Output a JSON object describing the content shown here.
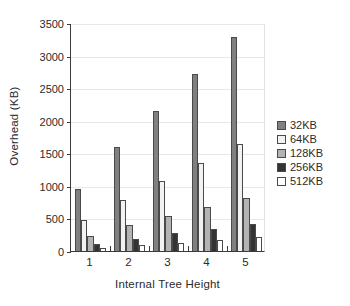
{
  "chart_data": {
    "type": "bar",
    "title": "",
    "xlabel": "Internal Tree Height",
    "ylabel": "Overhead (KB)",
    "categories": [
      "1",
      "2",
      "3",
      "4",
      "5"
    ],
    "ylim": [
      0,
      3500
    ],
    "yticks": [
      0,
      500,
      1000,
      1500,
      2000,
      2500,
      3000,
      3500
    ],
    "ytick_labels": [
      "0",
      "500",
      "1000",
      "1500",
      "2000",
      "2500",
      "3000",
      "3500"
    ],
    "grid": true,
    "legend_position": "right",
    "series": [
      {
        "name": "32KB",
        "color": "#808080",
        "values": [
          950,
          1590,
          2150,
          2720,
          3290
        ]
      },
      {
        "name": "64KB",
        "color": "#f2f2f2",
        "values": [
          480,
          790,
          1070,
          1355,
          1650
        ]
      },
      {
        "name": "128KB",
        "color": "#b3b3b3",
        "values": [
          230,
          400,
          540,
          680,
          820
        ]
      },
      {
        "name": "256KB",
        "color": "#333333",
        "values": [
          110,
          190,
          270,
          340,
          420
        ]
      },
      {
        "name": "512KB",
        "color": "#ffffff",
        "values": [
          50,
          90,
          130,
          175,
          210
        ]
      }
    ]
  }
}
